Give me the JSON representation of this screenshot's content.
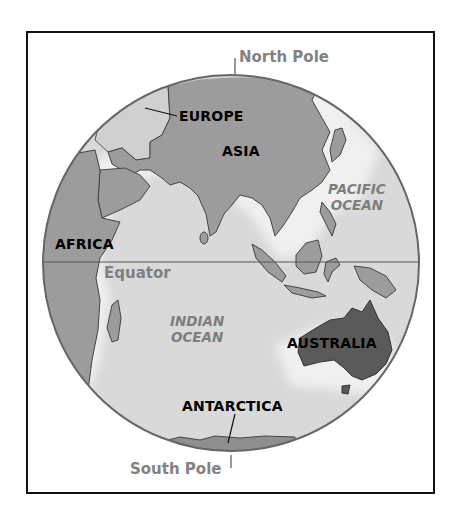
{
  "map": {
    "title": "Eastern Hemisphere globe",
    "colors": {
      "frame": "#111111",
      "ocean": "#d9d9d9",
      "land": "#9c9c9c",
      "land_highlight": "#cfcfcf",
      "australia": "#5a5a5a",
      "coast": "#444444",
      "ocean_label": "#7d7d7d",
      "pole_label": "#828282"
    },
    "labels": {
      "north_pole": "North Pole",
      "south_pole": "South Pole",
      "equator": "Equator",
      "continents": {
        "europe": "EUROPE",
        "asia": "ASIA",
        "africa": "AFRICA",
        "australia": "AUSTRALIA",
        "antarctica": "ANTARCTICA"
      },
      "oceans": {
        "pacific_line1": "PACIFIC",
        "pacific_line2": "OCEAN",
        "indian_line1": "INDIAN",
        "indian_line2": "OCEAN"
      }
    }
  }
}
